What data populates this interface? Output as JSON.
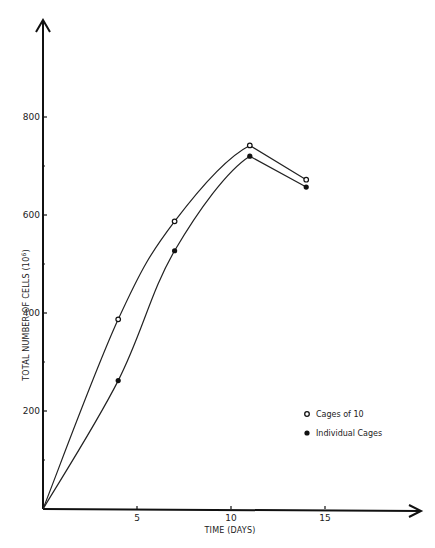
{
  "header": {
    "text": ""
  },
  "chart_data": {
    "type": "line",
    "title": "",
    "xlabel": "TIME (DAYS)",
    "ylabel": "TOTAL NUMBER OF CELLS (10^6)",
    "ylabel_base": "TOTAL NUMBER OF CELLS (10",
    "ylabel_sup": "6",
    "ylabel_close": ")",
    "xlim": [
      0,
      20
    ],
    "ylim": [
      0,
      1000
    ],
    "x_ticks": [
      5,
      10,
      15
    ],
    "x_tick_labels": [
      "5",
      "10",
      "15"
    ],
    "y_ticks": [
      200,
      400,
      600,
      800
    ],
    "y_tick_labels": [
      "200",
      "400",
      "600",
      "800"
    ],
    "y_minor_ticks": [
      100,
      300,
      500,
      700
    ],
    "grid": false,
    "legend_position": "lower right",
    "series": [
      {
        "name": "Cages of 10",
        "marker": "open-circle",
        "x": [
          0,
          4,
          7,
          11,
          14
        ],
        "y": [
          0,
          387,
          587,
          742,
          672
        ]
      },
      {
        "name": "Individual Cages",
        "marker": "filled-circle",
        "x": [
          0,
          4,
          7,
          11,
          14
        ],
        "y": [
          0,
          262,
          527,
          720,
          657
        ]
      }
    ]
  }
}
